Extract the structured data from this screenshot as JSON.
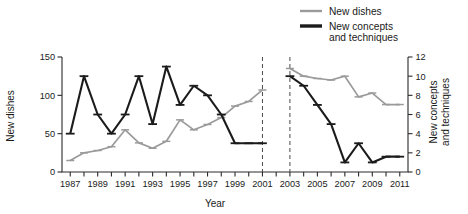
{
  "chart_data": {
    "type": "line",
    "title": "",
    "xlabel": "Year",
    "grid": false,
    "legend_position": "top-right",
    "x": [
      1987,
      1988,
      1989,
      1990,
      1991,
      1992,
      1993,
      1994,
      1995,
      1996,
      1997,
      1998,
      1999,
      2000,
      2001,
      2003,
      2004,
      2005,
      2006,
      2007,
      2008,
      2009,
      2010,
      2011
    ],
    "xlim": [
      1986.4,
      2011.6
    ],
    "xticks": [
      1987,
      1988,
      1989,
      1990,
      1991,
      1992,
      1993,
      1994,
      1995,
      1996,
      1997,
      1998,
      1999,
      2000,
      2001,
      2002,
      2003,
      2004,
      2005,
      2006,
      2007,
      2008,
      2009,
      2010,
      2011
    ],
    "xtick_labels_shown": [
      "1987",
      "1989",
      "1991",
      "1993",
      "1995",
      "1997",
      "1999",
      "2001",
      "2003",
      "2005",
      "2007",
      "2009",
      "2011"
    ],
    "gap_years": [
      2002
    ],
    "dividers": [
      2001,
      2003
    ],
    "axes": [
      {
        "id": "left",
        "label": "New dishes",
        "ylim": [
          0,
          150
        ],
        "yticks": [
          0,
          50,
          100,
          150
        ],
        "ytick_labels": [
          "0",
          "50",
          "100",
          "150"
        ]
      },
      {
        "id": "right",
        "label": "New concepts and techniques",
        "ylim": [
          0,
          12
        ],
        "yticks": [
          0,
          2,
          4,
          6,
          8,
          10,
          12
        ],
        "ytick_labels": [
          "0",
          "2",
          "4",
          "6",
          "8",
          "10",
          "12"
        ]
      }
    ],
    "series": [
      {
        "name": "New dishes",
        "axis": "left",
        "color": "#9a9a9a",
        "has_error_bars": true,
        "values": [
          15,
          25,
          28,
          33,
          55,
          38,
          31,
          40,
          68,
          55,
          62,
          71,
          86,
          92,
          107,
          135,
          125,
          122,
          120,
          125,
          98,
          103,
          88,
          88
        ]
      },
      {
        "name": "New concepts and techniques",
        "axis": "right",
        "color": "#1b1b1b",
        "has_error_bars": true,
        "values": [
          4,
          10,
          6,
          4,
          6,
          10,
          5,
          11,
          7,
          9,
          8,
          6,
          3,
          3,
          3,
          10,
          9,
          7,
          5,
          1,
          3,
          1,
          1.6,
          1.6
        ]
      }
    ]
  },
  "legend": {
    "items": [
      {
        "label": "New dishes",
        "color": "#9a9a9a"
      },
      {
        "label": "New concepts and techniques",
        "label_line1": "New concepts",
        "label_line2": "and techniques",
        "color": "#1b1b1b"
      }
    ]
  },
  "axis_titles": {
    "left": "New dishes",
    "right_line1": "New concepts",
    "right_line2": "and techniques",
    "bottom": "Year"
  },
  "left_ticks": [
    "150",
    "100",
    "50",
    "0"
  ],
  "right_ticks": [
    "12",
    "10",
    "8",
    "6",
    "4",
    "2",
    "0"
  ],
  "x_tick_labels": [
    "1987",
    "1989",
    "1991",
    "1993",
    "1995",
    "1997",
    "1999",
    "2001",
    "2003",
    "2005",
    "2007",
    "2009",
    "2011"
  ]
}
